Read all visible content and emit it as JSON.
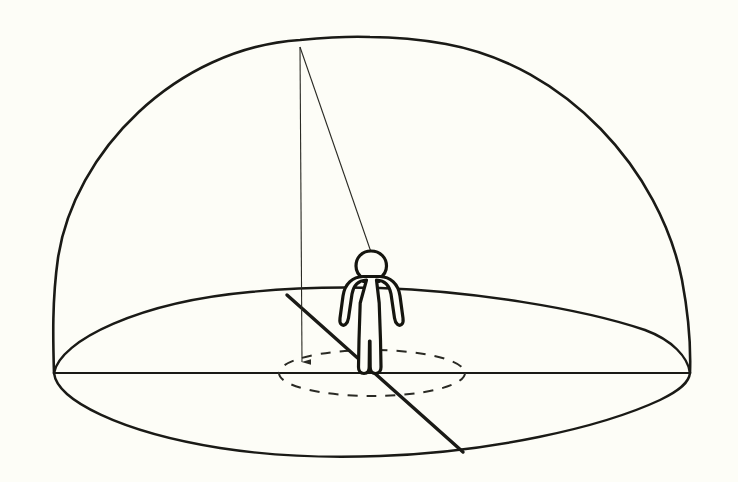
{
  "scene": {
    "title": "Hemispherical sky dome with observer and zenith projection",
    "background_color": "#fdfdf7",
    "ink_color": "#1a1a16",
    "canvas": {
      "width": 738,
      "height": 482
    }
  },
  "chart_data": {
    "type": "diagram",
    "title": "Hemispherical sky dome with standing observer",
    "elements": [
      {
        "name": "dome",
        "kind": "hemisphere-outline",
        "apex": [
          370,
          37
        ],
        "left_base": [
          54,
          373
        ],
        "right_base": [
          690,
          373
        ]
      },
      {
        "name": "horizon-plane-ellipse",
        "kind": "ellipse",
        "center": [
          372,
          373
        ],
        "rx": 318,
        "ry": 85
      },
      {
        "name": "horizon-line",
        "kind": "line",
        "from": [
          54,
          373
        ],
        "to": [
          690,
          373
        ]
      },
      {
        "name": "zenith-drop-line",
        "kind": "line-with-arrow",
        "from": [
          300,
          47
        ],
        "to": [
          302,
          368
        ],
        "arrowhead": "down"
      },
      {
        "name": "sight-line-to-head",
        "kind": "line",
        "from": [
          300,
          47
        ],
        "to": [
          371,
          252
        ]
      },
      {
        "name": "ground-chord-line",
        "kind": "thick-line",
        "from": [
          287,
          295
        ],
        "to": [
          463,
          452
        ]
      },
      {
        "name": "foot-circle",
        "kind": "dashed-ellipse",
        "center": [
          372,
          373
        ],
        "rx": 93,
        "ry": 23
      },
      {
        "name": "human-figure",
        "kind": "silhouette",
        "head_top": [
          371,
          252
        ],
        "feet": [
          372,
          374
        ],
        "height_px": 122
      }
    ],
    "stroke_weights": {
      "dome": 2.6,
      "plane_ellipse": 2.4,
      "horizon_line": 2.2,
      "thick_chord": 3.4,
      "thin_rays": 1.1,
      "dashed_circle": 2.0,
      "figure": 3.2
    },
    "xlabel": "",
    "ylabel": "",
    "legend": [],
    "annotations": []
  }
}
